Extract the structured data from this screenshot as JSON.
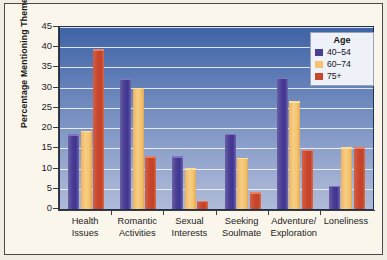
{
  "chart_data": {
    "type": "bar",
    "title": "",
    "xlabel": "",
    "ylabel": "Percentage Mentioning Theme",
    "ylim": [
      0,
      45
    ],
    "ytick_step": 5,
    "yticks": [
      0,
      5,
      10,
      15,
      20,
      25,
      30,
      35,
      40,
      45
    ],
    "ytick_labels": [
      "0",
      "5",
      "10",
      "15",
      "20",
      "25",
      "30",
      "35",
      "40",
      "45"
    ],
    "grid": "horizontal",
    "legend_position": "top-right",
    "legend_title": "Age",
    "categories": [
      "Health Issues",
      "Romantic Activities",
      "Sexual Interests",
      "Seeking Soulmate",
      "Adventure/ Exploration",
      "Loneliness"
    ],
    "category_lines": [
      [
        "Health",
        "Issues"
      ],
      [
        "Romantic",
        "Activities"
      ],
      [
        "Sexual",
        "Interests"
      ],
      [
        "Seeking",
        "Soulmate"
      ],
      [
        "Adventure/",
        "Exploration"
      ],
      [
        "Loneliness",
        ""
      ]
    ],
    "series": [
      {
        "name": "40–54",
        "color": "#4a3f92",
        "values": [
          18.5,
          32.2,
          13.1,
          18.6,
          32.5,
          5.8
        ]
      },
      {
        "name": "60–74",
        "color": "#f3c371",
        "values": [
          19.3,
          30.0,
          10.1,
          12.7,
          26.7,
          15.3
        ]
      },
      {
        "name": "75+",
        "color": "#c9472f",
        "values": [
          39.5,
          13.0,
          2.0,
          4.1,
          14.6,
          15.3
        ]
      }
    ]
  },
  "figure": {
    "background_color": "#faf6ec",
    "plot_background_top": "#3f62a4",
    "plot_background_bottom": "#afbad8",
    "gridline_color": "#f0f3f8",
    "axis_color": "#3b3b39",
    "border_color": "#4a4a48"
  }
}
